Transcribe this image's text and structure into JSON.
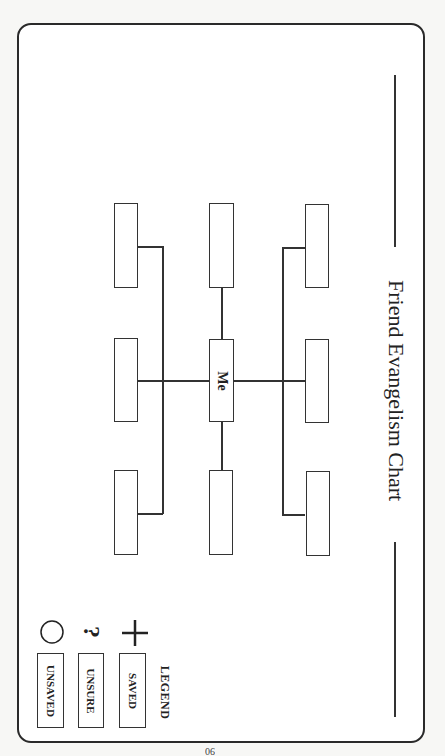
{
  "title": "Friend Evangelism Chart",
  "center_label": "Me",
  "legend": {
    "title": "LEGEND",
    "items": [
      {
        "symbol": "plus-icon",
        "glyph": "+",
        "label": "SAVED"
      },
      {
        "symbol": "question-icon",
        "glyph": "?",
        "label": "UNSURE"
      },
      {
        "symbol": "circle-icon",
        "glyph": "○",
        "label": "UNSAVED"
      }
    ]
  },
  "page_number": "90",
  "colors": {
    "stroke": "#333333",
    "background": "#ffffff"
  }
}
